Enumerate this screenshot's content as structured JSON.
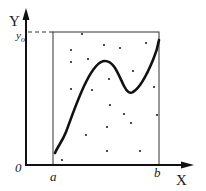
{
  "figure": {
    "type": "monte-carlo-integration-diagram",
    "labels": {
      "y_axis": "Y",
      "y0_main": "y",
      "y0_sub": "o",
      "origin": "0",
      "a": "a",
      "b": "b",
      "x_axis": "X"
    },
    "colors": {
      "ink": "#111111",
      "box": "#333333",
      "background": "#ffffff"
    },
    "geometry": {
      "y_axis": {
        "x": 26,
        "y_top": 12,
        "y_bottom": 165
      },
      "x_axis": {
        "y": 165,
        "x_left": 26,
        "x_right": 192
      },
      "box": {
        "left": 53,
        "right": 159,
        "top": 32,
        "bottom": 165
      },
      "dashed_line": {
        "x1": 28,
        "x2": 53,
        "y": 32
      }
    },
    "curve_path": "M55,153 C58,146 62,142 66,132 C72,116 78,98 86,82 C92,70 98,61 105,61 C114,61 118,74 124,86 C127,92 130,94 133,92 C140,88 148,72 153,60 C156,53 158,46 159,40",
    "random_points": [
      [
        82,
        34
      ],
      [
        71,
        50
      ],
      [
        104,
        45
      ],
      [
        120,
        48
      ],
      [
        146,
        43
      ],
      [
        71,
        62
      ],
      [
        88,
        59
      ],
      [
        133,
        71
      ],
      [
        109,
        79
      ],
      [
        71,
        89
      ],
      [
        92,
        90
      ],
      [
        154,
        87
      ],
      [
        86,
        135
      ],
      [
        110,
        105
      ],
      [
        124,
        114
      ],
      [
        131,
        123
      ],
      [
        157,
        115
      ],
      [
        107,
        127
      ],
      [
        107,
        151
      ],
      [
        140,
        151
      ],
      [
        62,
        160
      ]
    ]
  }
}
